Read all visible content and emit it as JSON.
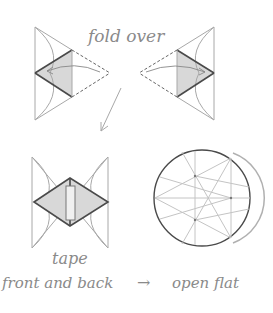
{
  "diagram": {
    "labels": {
      "fold_over": "fold over",
      "tape": "tape",
      "front_and_back": "front and back",
      "arrow": "→",
      "open_flat": "open flat"
    },
    "colors": {
      "line": "#a8a8a8",
      "thick_line": "#4a4a4a",
      "shade": "#d8d8d8",
      "text": "#8a8a8a",
      "background": "#ffffff"
    },
    "steps": [
      {
        "name": "fold-left-flap",
        "description": "Fold right flap over to the left"
      },
      {
        "name": "fold-right-flap",
        "description": "Fold left flap over to the right"
      },
      {
        "name": "tape-center",
        "description": "Tape front and back"
      },
      {
        "name": "open-flat",
        "description": "Open flat into a circle"
      }
    ]
  }
}
